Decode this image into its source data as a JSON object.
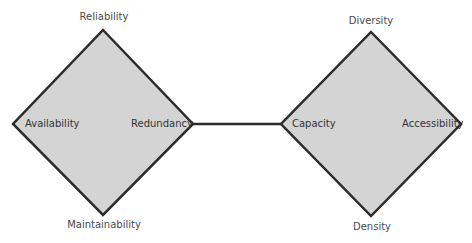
{
  "colors": {
    "diamond_fill": "#d4d4d4",
    "stroke": "#2b2b2b",
    "label_outside": "#4a4a4a",
    "label_inside": "#333333",
    "background": "#ffffff"
  },
  "left_diamond": {
    "top_label": "Reliability",
    "bottom_label": "Maintainability",
    "left_label": "Availability",
    "right_label": "Redundancy"
  },
  "right_diamond": {
    "top_label": "Diversity",
    "bottom_label": "Density",
    "left_label": "Capacity",
    "right_label": "Accessibility"
  },
  "connector": {
    "from": "Redundancy",
    "to": "Capacity"
  }
}
